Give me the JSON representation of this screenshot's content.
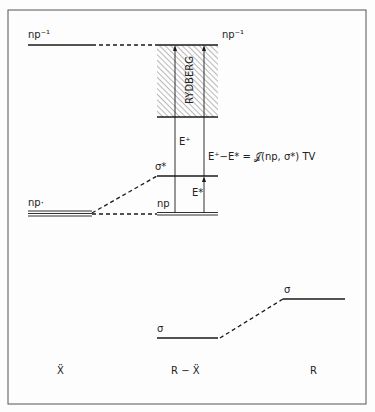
{
  "diagram": {
    "title": "",
    "columns": [
      {
        "id": "X",
        "label": "Ẍ"
      },
      {
        "id": "RX",
        "label": "R − Ẍ"
      },
      {
        "id": "R",
        "label": "R"
      }
    ],
    "levels": {
      "np_inv_left": "np⁻¹",
      "np_inv_right": "np⁻¹",
      "sigma_star": "σ*",
      "np_left": "np·",
      "np_center": "np",
      "sigma_center": "σ",
      "sigma_right": "σ"
    },
    "band_label": "RYDBERG",
    "arrows": {
      "e_plus": "E⁺",
      "e_star": "E*",
      "difference": "E⁺−E* = 𝒥(np, σ*) TV"
    },
    "colors": {
      "line": "#1a1a1a",
      "hatch": "#888888",
      "background": "#fdfdfd"
    }
  }
}
